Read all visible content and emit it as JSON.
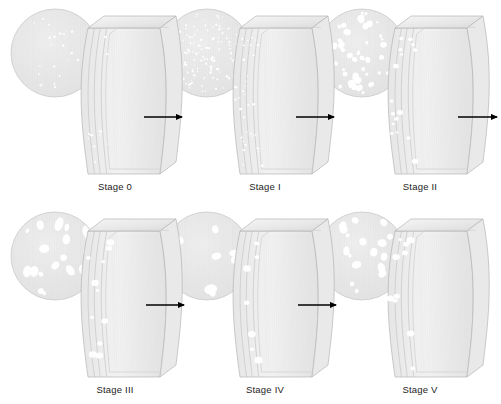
{
  "figure": {
    "background_color": "#ffffff",
    "label_color": "#1c1c1c",
    "arrow_color": "#000000",
    "body_fill": "#efefef",
    "body_stroke": "#b4b4b4",
    "inset_fill": "#e8e8e8",
    "inset_stroke": "#c9c9c9",
    "void_color": "#ffffff",
    "rows": 2,
    "columns": 3
  },
  "chart_data": {
    "type": "diagram",
    "categories": [
      "Stage 0",
      "Stage I",
      "Stage II",
      "Stage III",
      "Stage IV",
      "Stage V"
    ],
    "series": [
      {
        "name": "void count (inset)",
        "values": [
          22,
          150,
          48,
          20,
          9,
          18
        ]
      },
      {
        "name": "mean void size (px)",
        "values": [
          1.2,
          1.4,
          3.0,
          4.2,
          5.0,
          3.6
        ]
      }
    ],
    "xlabel": "Damage stage",
    "ylabel": "Void population",
    "legend": "none",
    "grid": false
  },
  "stages": [
    {
      "id": "stage-0",
      "label": "Stage 0",
      "row": 0,
      "col": 0,
      "inset": {
        "cx": 55,
        "cy": 53,
        "r": 44,
        "seed": 11,
        "count": 22,
        "min_r": 0.5,
        "max_r": 1.3,
        "elong": 1.0
      },
      "body": {
        "x": 88,
        "y": 28,
        "w": 72,
        "h": 146
      },
      "surface_voids": {
        "seed": 111,
        "count": 10,
        "min_r": 0.6,
        "max_r": 1.3
      },
      "label_x": 115,
      "label_y": 181
    },
    {
      "id": "stage-1",
      "label": "Stage I",
      "row": 0,
      "col": 1,
      "inset": {
        "cx": 207,
        "cy": 53,
        "r": 44,
        "seed": 23,
        "count": 150,
        "min_r": 0.5,
        "max_r": 1.25,
        "elong": 1.0
      },
      "body": {
        "x": 240,
        "y": 28,
        "w": 72,
        "h": 146
      },
      "surface_voids": {
        "seed": 222,
        "count": 34,
        "min_r": 0.6,
        "max_r": 1.3
      },
      "label_x": 265,
      "label_y": 181
    },
    {
      "id": "stage-2",
      "label": "Stage II",
      "row": 0,
      "col": 2,
      "inset": {
        "cx": 362,
        "cy": 53,
        "r": 44,
        "seed": 37,
        "count": 48,
        "min_r": 1.1,
        "max_r": 3.4,
        "elong": 1.25
      },
      "body": {
        "x": 395,
        "y": 28,
        "w": 72,
        "h": 146
      },
      "surface_voids": {
        "seed": 333,
        "count": 16,
        "min_r": 1.0,
        "max_r": 2.6
      },
      "label_x": 420,
      "label_y": 181
    },
    {
      "id": "stage-3",
      "label": "Stage III",
      "row": 1,
      "col": 0,
      "inset": {
        "cx": 55,
        "cy": 256,
        "r": 44,
        "seed": 53,
        "count": 20,
        "min_r": 1.6,
        "max_r": 4.6,
        "elong": 1.8
      },
      "body": {
        "x": 88,
        "y": 231,
        "w": 72,
        "h": 146
      },
      "surface_voids": {
        "seed": 444,
        "count": 11,
        "min_r": 1.3,
        "max_r": 3.4
      },
      "label_x": 115,
      "label_y": 384
    },
    {
      "id": "stage-4",
      "label": "Stage IV",
      "row": 1,
      "col": 1,
      "inset": {
        "cx": 207,
        "cy": 256,
        "r": 44,
        "seed": 67,
        "count": 9,
        "min_r": 2.2,
        "max_r": 5.2,
        "elong": 1.7
      },
      "body": {
        "x": 240,
        "y": 231,
        "w": 72,
        "h": 146
      },
      "surface_voids": {
        "seed": 555,
        "count": 7,
        "min_r": 1.6,
        "max_r": 3.8
      },
      "label_x": 265,
      "label_y": 384
    },
    {
      "id": "stage-5",
      "label": "Stage V",
      "row": 1,
      "col": 2,
      "inset": {
        "cx": 362,
        "cy": 256,
        "r": 44,
        "seed": 83,
        "count": 18,
        "min_r": 1.5,
        "max_r": 4.0,
        "elong": 1.5
      },
      "body": {
        "x": 395,
        "y": 231,
        "w": 72,
        "h": 146
      },
      "surface_voids": {
        "seed": 666,
        "count": 10,
        "min_r": 1.4,
        "max_r": 3.2
      },
      "label_x": 420,
      "label_y": 384
    }
  ],
  "arrows": [
    {
      "id": "arrow-0-to-1",
      "x1": 144,
      "y1": 117,
      "x2": 182,
      "y2": 117
    },
    {
      "id": "arrow-1-to-2",
      "x1": 296,
      "y1": 117,
      "x2": 334,
      "y2": 117
    },
    {
      "id": "arrow-2-to-3",
      "x1": 458,
      "y1": 117,
      "x2": 497,
      "y2": 117
    },
    {
      "id": "arrow-3-to-4",
      "x1": 146,
      "y1": 305,
      "x2": 184,
      "y2": 305
    },
    {
      "id": "arrow-4-to-5",
      "x1": 298,
      "y1": 305,
      "x2": 336,
      "y2": 305
    }
  ]
}
